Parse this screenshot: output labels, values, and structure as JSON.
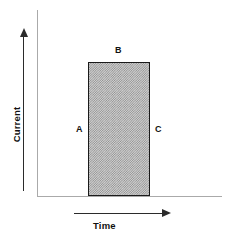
{
  "figure": {
    "background_color": "#ffffff"
  },
  "axes": {
    "y": {
      "title": "Current",
      "arrow_direction": "up",
      "line_color": "#aaaaaa",
      "arrow_color": "#2b2b2b"
    },
    "x": {
      "title": "Time",
      "arrow_direction": "right",
      "line_color": "#aaaaaa",
      "arrow_color": "#2b2b2b"
    }
  },
  "annotations": {
    "a": "A",
    "b": "B",
    "c": "C"
  },
  "chart_data": {
    "type": "area",
    "title": "",
    "xlabel": "Time",
    "ylabel": "Current",
    "grid": false,
    "legend": null,
    "x": [
      0,
      1,
      1,
      2,
      2,
      3
    ],
    "values": [
      0,
      0,
      1,
      1,
      0,
      0
    ],
    "series": [
      {
        "name": "Current pulse",
        "x": [
          0,
          1,
          1,
          2,
          2,
          3
        ],
        "values": [
          0,
          0,
          1,
          1,
          0,
          0
        ],
        "fill": "hatched-checker-gray",
        "fill_color": "#cfcfcf",
        "edge_color": "#1a1a1a"
      }
    ],
    "annotations": [
      {
        "label": "A",
        "position": "left-edge-of-pulse",
        "describes": "rising edge / leading edge of the current pulse"
      },
      {
        "label": "B",
        "position": "top-edge-of-pulse",
        "describes": "plateau / peak amplitude of the current pulse"
      },
      {
        "label": "C",
        "position": "right-edge-of-pulse",
        "describes": "falling edge / trailing edge of the current pulse"
      }
    ],
    "xlim": [
      0,
      3
    ],
    "ylim": [
      0,
      1.35
    ],
    "xticks": [],
    "yticks": []
  }
}
